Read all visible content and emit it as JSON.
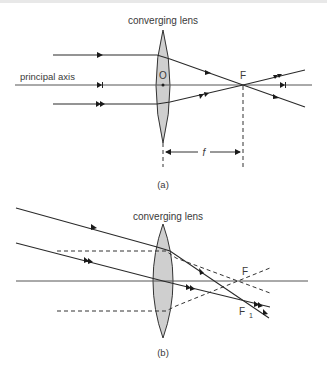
{
  "diagram_a": {
    "lens_label": "converging lens",
    "axis_label": "principal axis",
    "optical_centre_label": "O",
    "focal_point_label": "F",
    "focal_length_label": "f",
    "caption": "(a)"
  },
  "diagram_b": {
    "lens_label": "converging lens",
    "focal_point_label": "F",
    "secondary_focal_label": "F",
    "secondary_focal_subscript": "1",
    "caption": "(b)"
  },
  "colors": {
    "lens_fill": "#cfcfcf",
    "line": "#2a2a2a"
  }
}
